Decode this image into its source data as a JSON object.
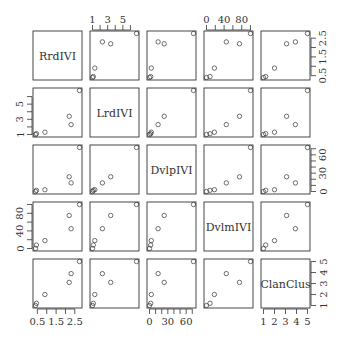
{
  "chart_data": {
    "type": "scatter",
    "subtype": "scatterplot-matrix",
    "title": "",
    "variables": [
      "RrdIVI",
      "LrdIVI",
      "DvlpIVI",
      "DvlmIVI",
      "ClanClus"
    ],
    "observations": {
      "RrdIVI": [
        0.4,
        0.9,
        0.45,
        2.3,
        2.2,
        2.75
      ],
      "LrdIVI": [
        1.0,
        1.3,
        1.1,
        2.3,
        3.4,
        6.8
      ],
      "DvlpIVI": [
        0,
        3,
        2,
        14,
        24,
        72
      ],
      "DvlmIVI": [
        0,
        18,
        8,
        45,
        75,
        100
      ],
      "ClanClus": [
        1,
        2,
        1.2,
        3.9,
        3.1,
        5
      ]
    },
    "ranges": {
      "RrdIVI": [
        0.4,
        2.75
      ],
      "LrdIVI": [
        1.0,
        6.8
      ],
      "DvlpIVI": [
        0,
        72
      ],
      "DvlmIVI": [
        0,
        100
      ],
      "ClanClus": [
        1,
        5
      ]
    },
    "axes": {
      "top": [
        {
          "variable": "LrdIVI",
          "ticks": [
            1,
            2,
            3,
            4,
            5,
            6
          ],
          "labels": [
            "1",
            "3",
            "5"
          ],
          "label_values": [
            1,
            3,
            5
          ]
        },
        {
          "variable": "DvlmIVI",
          "ticks": [
            0,
            20,
            40,
            60,
            80,
            100
          ],
          "labels": [
            "0",
            "40",
            "80"
          ],
          "label_values": [
            0,
            40,
            80
          ]
        }
      ],
      "right": [
        {
          "variable": "RrdIVI",
          "ticks": [
            0.5,
            1.0,
            1.5,
            2.0,
            2.5
          ],
          "labels": [
            "0.5",
            "1.5",
            "2.5"
          ],
          "label_values": [
            0.5,
            1.5,
            2.5
          ]
        },
        {
          "variable": "DvlpIVI",
          "ticks": [
            0,
            10,
            20,
            30,
            40,
            50,
            60,
            70
          ],
          "labels": [
            "0",
            "30",
            "60"
          ],
          "label_values": [
            0,
            30,
            60
          ]
        },
        {
          "variable": "ClanClus",
          "ticks": [
            1,
            2,
            3,
            4,
            5
          ],
          "labels": [
            "1",
            "2",
            "3",
            "4",
            "5"
          ],
          "label_values": [
            1,
            2,
            3,
            4,
            5
          ]
        }
      ],
      "left": [
        {
          "variable": "LrdIVI",
          "ticks": [
            1,
            2,
            3,
            4,
            5,
            6
          ],
          "labels": [
            "1",
            "3",
            "5"
          ],
          "label_values": [
            1,
            3,
            5
          ]
        },
        {
          "variable": "DvlmIVI",
          "ticks": [
            0,
            20,
            40,
            60,
            80,
            100
          ],
          "labels": [
            "0",
            "40",
            "80"
          ],
          "label_values": [
            0,
            40,
            80
          ]
        }
      ],
      "bottom": [
        {
          "variable": "RrdIVI",
          "ticks": [
            0.5,
            1.0,
            1.5,
            2.0,
            2.5
          ],
          "labels": [
            "0.5",
            "1.5",
            "2.5"
          ],
          "label_values": [
            0.5,
            1.5,
            2.5
          ]
        },
        {
          "variable": "DvlpIVI",
          "ticks": [
            0,
            10,
            20,
            30,
            40,
            50,
            60,
            70
          ],
          "labels": [
            "0",
            "30",
            "60"
          ],
          "label_values": [
            0,
            30,
            60
          ]
        },
        {
          "variable": "ClanClus",
          "ticks": [
            1,
            2,
            3,
            4,
            5
          ],
          "labels": [
            "1",
            "2",
            "3",
            "4",
            "5"
          ],
          "label_values": [
            1,
            2,
            3,
            4,
            5
          ]
        }
      ]
    },
    "grid": false,
    "legend": null,
    "marker": "open-circle"
  }
}
